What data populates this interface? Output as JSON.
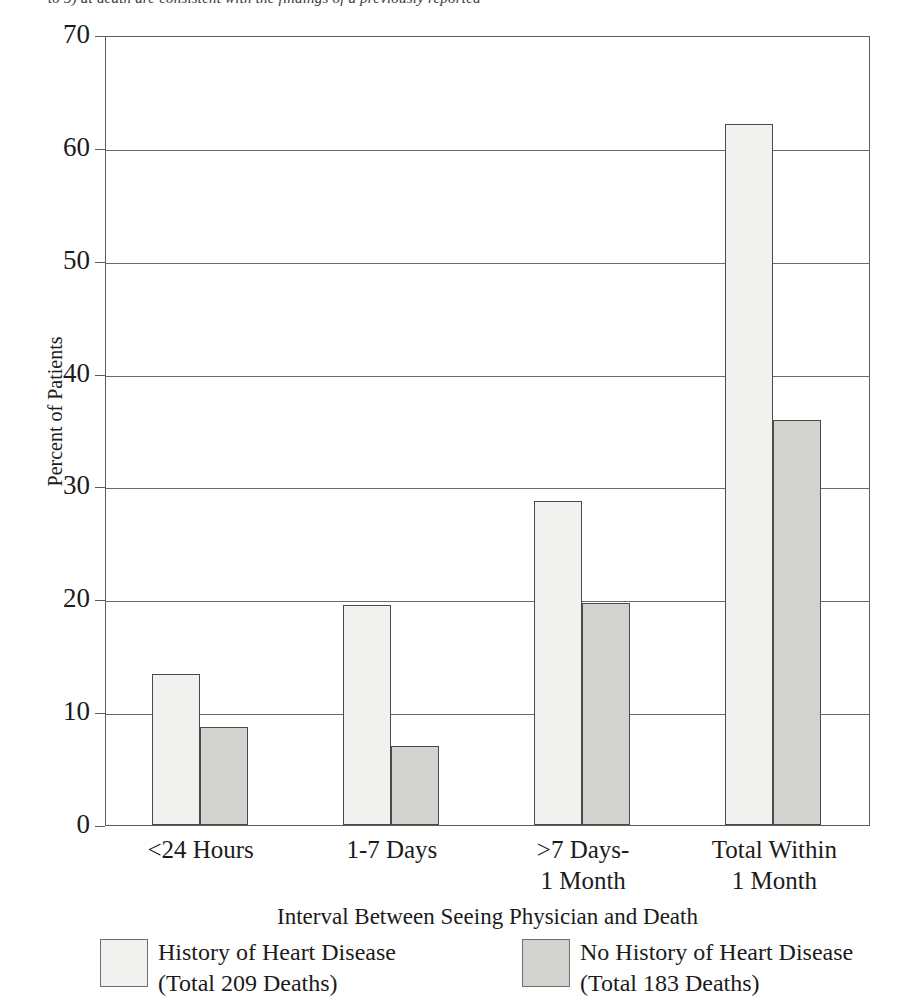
{
  "caption": {
    "clipped_line": "to 5) at death   are consistent with the findings of a previously reported"
  },
  "chart_data": {
    "type": "bar",
    "title": "",
    "xlabel": "Interval Between Seeing Physician and Death",
    "ylabel": "Percent of Patients",
    "ylim": [
      0,
      70
    ],
    "ytick_step": 10,
    "yticks": [
      "0",
      "10",
      "20",
      "30",
      "40",
      "50",
      "60",
      "70"
    ],
    "grid": true,
    "legend_position": "bottom",
    "categories": [
      "<24 Hours",
      "1-7 Days",
      ">7 Days-\n1 Month",
      "Total Within\n1 Month"
    ],
    "series": [
      {
        "name": "History of Heart Disease",
        "sublabel": "(Total 209 Deaths)",
        "color": "#f1f1ef",
        "values": [
          13.4,
          19.5,
          28.7,
          62.1
        ]
      },
      {
        "name": "No History of Heart Disease",
        "sublabel": "(Total 183 Deaths)",
        "color": "#d2d2cf",
        "values": [
          8.7,
          7.0,
          19.7,
          35.9
        ]
      }
    ]
  },
  "legend": {
    "items": [
      {
        "label": "History of Heart Disease\n(Total 209 Deaths)",
        "swatch": "light"
      },
      {
        "label": "No History of Heart Disease\n(Total 183 Deaths)",
        "swatch": "dark"
      }
    ]
  },
  "axis": {
    "y_title": "Percent of Patients",
    "x_title": "Interval Between Seeing Physician and Death"
  }
}
